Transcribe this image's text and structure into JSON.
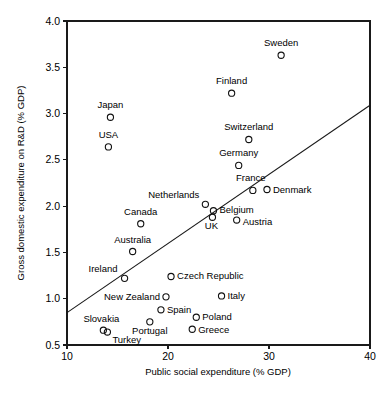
{
  "chart_data": {
    "type": "scatter",
    "title": "",
    "xlabel": "Public social expenditure (% GDP)",
    "ylabel": "Gross domestic expenditure on R&D (% GDP)",
    "xlim": [
      10,
      40
    ],
    "ylim": [
      0.5,
      4.0
    ],
    "xticks": [
      "10",
      "20",
      "30",
      "40"
    ],
    "xtick_values": [
      10,
      20,
      30,
      40
    ],
    "yticks": [
      "0.5",
      "1.0",
      "1.5",
      "2.0",
      "2.5",
      "3.0",
      "3.5",
      "4.0"
    ],
    "ytick_values": [
      0.5,
      1.0,
      1.5,
      2.0,
      2.5,
      3.0,
      3.5,
      4.0
    ],
    "grid": false,
    "legend": "none",
    "marker_style": "open-circle",
    "points": [
      {
        "label": "Sweden",
        "x": 31.2,
        "y": 3.63,
        "label_dx": 0,
        "label_dy": -9,
        "anchor": "middle"
      },
      {
        "label": "Finland",
        "x": 26.3,
        "y": 3.22,
        "label_dx": 0,
        "label_dy": -9,
        "anchor": "middle"
      },
      {
        "label": "Japan",
        "x": 14.3,
        "y": 2.96,
        "label_dx": 0,
        "label_dy": -9,
        "anchor": "middle"
      },
      {
        "label": "Switzerland",
        "x": 28.0,
        "y": 2.72,
        "label_dx": 0,
        "label_dy": -9,
        "anchor": "middle"
      },
      {
        "label": "USA",
        "x": 14.1,
        "y": 2.64,
        "label_dx": 0,
        "label_dy": -9,
        "anchor": "middle"
      },
      {
        "label": "Germany",
        "x": 27.0,
        "y": 2.44,
        "label_dx": 0,
        "label_dy": -9,
        "anchor": "middle"
      },
      {
        "label": "France",
        "x": 28.4,
        "y": 2.17,
        "label_dx": -2,
        "label_dy": -9,
        "anchor": "middle"
      },
      {
        "label": "Denmark",
        "x": 29.8,
        "y": 2.18,
        "label_dx": 6,
        "label_dy": 4,
        "anchor": "start"
      },
      {
        "label": "Netherlands",
        "x": 23.7,
        "y": 2.02,
        "label_dx": -6,
        "label_dy": -6,
        "anchor": "end"
      },
      {
        "label": "Belgium",
        "x": 24.5,
        "y": 1.95,
        "label_dx": 6,
        "label_dy": 2,
        "anchor": "start"
      },
      {
        "label": "UK",
        "x": 24.4,
        "y": 1.88,
        "label_dx": -1,
        "label_dy": 12,
        "anchor": "middle"
      },
      {
        "label": "Austria",
        "x": 26.8,
        "y": 1.85,
        "label_dx": 6,
        "label_dy": 5,
        "anchor": "start"
      },
      {
        "label": "Canada",
        "x": 17.3,
        "y": 1.81,
        "label_dx": 0,
        "label_dy": -9,
        "anchor": "middle"
      },
      {
        "label": "Australia",
        "x": 16.5,
        "y": 1.51,
        "label_dx": 0,
        "label_dy": -9,
        "anchor": "middle"
      },
      {
        "label": "Ireland",
        "x": 15.7,
        "y": 1.22,
        "label_dx": -7,
        "label_dy": -6,
        "anchor": "end"
      },
      {
        "label": "Czech Republic",
        "x": 20.3,
        "y": 1.24,
        "label_dx": 6,
        "label_dy": 3,
        "anchor": "start"
      },
      {
        "label": "Italy",
        "x": 25.3,
        "y": 1.03,
        "label_dx": 6,
        "label_dy": 3,
        "anchor": "start"
      },
      {
        "label": "New Zealand",
        "x": 19.8,
        "y": 1.02,
        "label_dx": -6,
        "label_dy": 3,
        "anchor": "end"
      },
      {
        "label": "Spain",
        "x": 19.3,
        "y": 0.88,
        "label_dx": 6,
        "label_dy": 3,
        "anchor": "start"
      },
      {
        "label": "Portugal",
        "x": 18.2,
        "y": 0.75,
        "label_dx": 0,
        "label_dy": 12,
        "anchor": "middle"
      },
      {
        "label": "Poland",
        "x": 22.8,
        "y": 0.8,
        "label_dx": 6,
        "label_dy": 3,
        "anchor": "start"
      },
      {
        "label": "Greece",
        "x": 22.4,
        "y": 0.67,
        "label_dx": 6,
        "label_dy": 4,
        "anchor": "start"
      },
      {
        "label": "Slovakia",
        "x": 13.6,
        "y": 0.66,
        "label_dx": -2,
        "label_dy": -8,
        "anchor": "middle"
      },
      {
        "label": "Turkey",
        "x": 14.0,
        "y": 0.64,
        "label_dx": 5,
        "label_dy": 11,
        "anchor": "start"
      }
    ],
    "trendline": {
      "x0": 10.0,
      "y0": 0.85,
      "x1": 40.0,
      "y1": 3.09
    }
  }
}
